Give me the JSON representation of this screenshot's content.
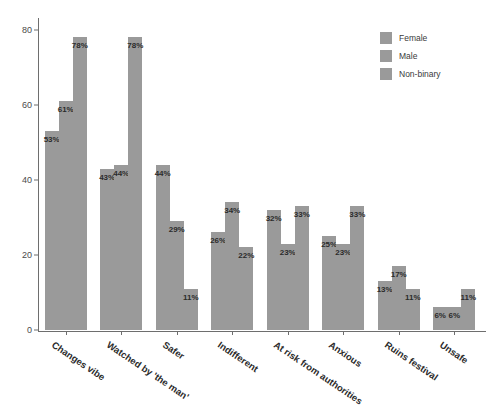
{
  "chart_data": {
    "type": "bar",
    "title": "",
    "subtitle": "",
    "xlabel": "",
    "ylabel": "",
    "ylim": [
      0,
      82
    ],
    "yticks": [
      0,
      20,
      40,
      60,
      80
    ],
    "grid": false,
    "legend_position": "top-right",
    "unit": "%",
    "categories": [
      "Changes vibe",
      "Watched by 'the man'",
      "Safer",
      "Indifferent",
      "At risk from authorities",
      "Anxious",
      "Ruins festival",
      "Unsafe"
    ],
    "series": [
      {
        "name": "Female",
        "color": "#9a9a9a",
        "values": [
          53,
          43,
          44,
          26,
          32,
          25,
          13,
          6
        ]
      },
      {
        "name": "Male",
        "color": "#9a9a9a",
        "values": [
          61,
          44,
          29,
          34,
          23,
          23,
          17,
          6
        ]
      },
      {
        "name": "Non-binary",
        "color": "#9a9a9a",
        "values": [
          78,
          78,
          11,
          22,
          33,
          33,
          11,
          11
        ]
      }
    ],
    "value_labels": [
      [
        "53%",
        "61%",
        "78%"
      ],
      [
        "43%",
        "44%",
        "78%"
      ],
      [
        "44%",
        "29%",
        "11%"
      ],
      [
        "26%",
        "34%",
        "22%"
      ],
      [
        "32%",
        "23%",
        "33%"
      ],
      [
        "25%",
        "23%",
        "33%"
      ],
      [
        "13%",
        "17%",
        "11%"
      ],
      [
        "6%",
        "6%",
        "11%"
      ]
    ],
    "ytick_labels": [
      "0",
      "20",
      "40",
      "60",
      "80"
    ]
  },
  "legend": {
    "items": [
      {
        "label": "Female"
      },
      {
        "label": "Male"
      },
      {
        "label": "Non-binary"
      }
    ]
  }
}
